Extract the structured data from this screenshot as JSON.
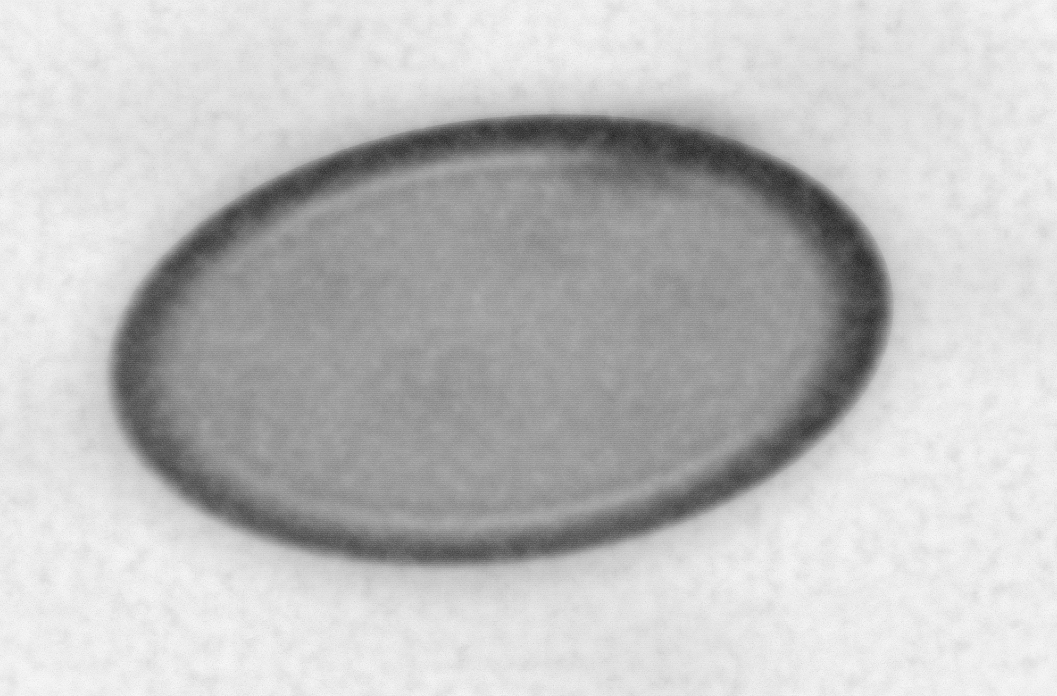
{
  "image": {
    "kind": "transmission-electron-micrograph",
    "subject": "enveloped ovoid virion (poxvirus morphology)",
    "color_mode": "grayscale",
    "width_px": 1057,
    "height_px": 696,
    "visible_text": [],
    "scale_bar": null,
    "annotations": [],
    "caption": ""
  },
  "palette": {
    "paper_white": "#ffffff",
    "background_light_gray": "#e8e8e8",
    "background_mid_gray": "#c9c9c9",
    "core_gray": "#9a9a9a",
    "membrane_dark": "#3a3a3a",
    "membrane_darkest": "#1a1a1a",
    "inner_line_light": "#d7d7d7"
  },
  "virion": {
    "shape": "ellipse",
    "center_x_px": 500,
    "center_y_px": 341,
    "width_px": 792,
    "height_px": 446,
    "rotation_deg": -7.5,
    "membrane_darkest_region": "upper-right",
    "membrane_faintest_region": "lower-left",
    "has_inner_light_line": true,
    "core_texture": "granular-mottled"
  },
  "margins": {
    "top_px": 22,
    "left_px": 24,
    "right_px": 26,
    "bottom_px": 18
  },
  "texture": {
    "grain": "fine film emulsion speckle",
    "scanlines": "faint horizontal raster lines"
  }
}
